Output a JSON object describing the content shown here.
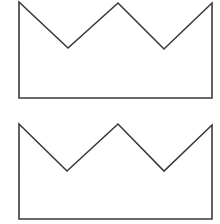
{
  "diagram": {
    "background": "#ffffff",
    "stroke_color": "#3a3a3a",
    "stroke_width": 1.6,
    "shapes": [
      {
        "name": "crown-top",
        "type": "crown-outline",
        "points": "19,2 68,48 118,3 164,49 212,3 212,98 19,98"
      },
      {
        "name": "crown-bottom",
        "type": "crown-outline",
        "points": "19,124 67,171 118,124 164,171 212,125 212,219 19,219"
      }
    ]
  }
}
